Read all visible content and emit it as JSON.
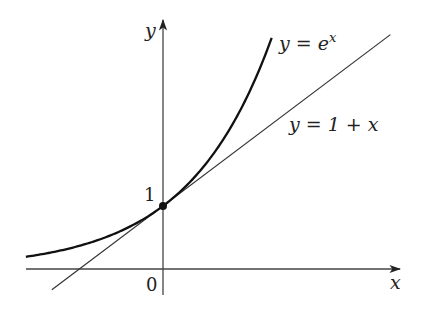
{
  "diagram": {
    "x_axis_label": "x",
    "y_axis_label": "y",
    "origin_label": "0",
    "y_intercept_label": "1",
    "curves": [
      {
        "name": "exponential",
        "label_lhs": "y = e",
        "label_sup": "x",
        "formula": "e^x",
        "x_range": [
          -1.64,
          1.3
        ]
      },
      {
        "name": "tangent-line",
        "label": "y = 1 + x",
        "formula": "1 + x",
        "x_range": [
          -1.33,
          2.72
        ]
      }
    ],
    "points": [
      {
        "name": "tangency-point",
        "x": 0,
        "y": 1
      }
    ],
    "colors": {
      "curve": "#111111",
      "line": "#333333",
      "axis": "#444444",
      "text": "#222222"
    }
  }
}
